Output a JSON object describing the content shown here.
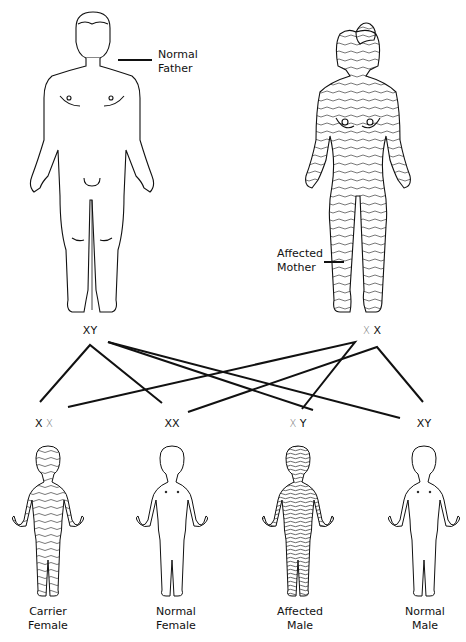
{
  "parents": {
    "father": {
      "label_line1": "Normal",
      "label_line2": "Father",
      "genotype": [
        {
          "allele": "X",
          "affected": false
        },
        {
          "allele": "Y",
          "affected": false
        }
      ],
      "shaded": false
    },
    "mother": {
      "label_line1": "Affected",
      "label_line2": "Mother",
      "genotype": [
        {
          "allele": "X",
          "affected": true
        },
        {
          "allele": "X",
          "affected": false
        }
      ],
      "shaded": true
    }
  },
  "children": [
    {
      "label_line1": "Carrier",
      "label_line2": "Female",
      "genotype": [
        {
          "allele": "X",
          "affected": false
        },
        {
          "allele": "X",
          "affected": true
        }
      ],
      "shading": "light"
    },
    {
      "label_line1": "Normal",
      "label_line2": "Female",
      "genotype": [
        {
          "allele": "X",
          "affected": false
        },
        {
          "allele": "X",
          "affected": false
        }
      ],
      "shading": "none"
    },
    {
      "label_line1": "Affected",
      "label_line2": "Male",
      "genotype": [
        {
          "allele": "X",
          "affected": true
        },
        {
          "allele": "Y",
          "affected": false
        }
      ],
      "shading": "dense"
    },
    {
      "label_line1": "Normal",
      "label_line2": "Male",
      "genotype": [
        {
          "allele": "X",
          "affected": false
        },
        {
          "allele": "Y",
          "affected": false
        }
      ],
      "shading": "none"
    }
  ],
  "colors": {
    "line": "#111111",
    "affected_allele": "#777777",
    "hatch": "#444444"
  }
}
